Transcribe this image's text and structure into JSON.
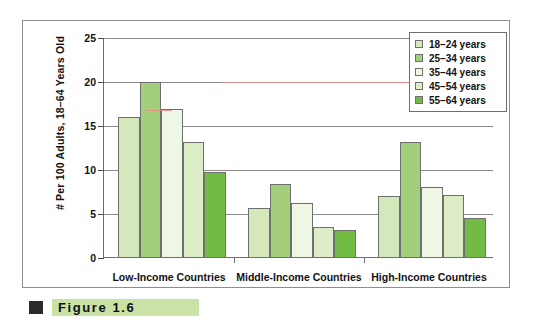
{
  "chart_data": {
    "type": "bar",
    "title": "",
    "subtitle": "",
    "xlabel": "",
    "ylabel": "# Per 100 Adults, 18–64 Years Old",
    "ylim": [
      0,
      25
    ],
    "yticks": [
      0,
      5,
      10,
      15,
      20,
      25
    ],
    "grid": true,
    "legend_position": "top-right",
    "categories": [
      "Low-Income Countries",
      "Middle-Income Countries",
      "High-Income Countries"
    ],
    "series": [
      {
        "name": "18–24 years",
        "color": "#d4e8bc",
        "values": [
          15.9,
          5.6,
          6.9
        ]
      },
      {
        "name": "25–34 years",
        "color": "#a3cf7c",
        "values": [
          19.9,
          8.3,
          13.1
        ]
      },
      {
        "name": "35–44 years",
        "color": "#eef6e4",
        "values": [
          16.8,
          6.1,
          8.0
        ]
      },
      {
        "name": "45–54 years",
        "color": "#dcecc6",
        "values": [
          13.1,
          3.4,
          7.1
        ]
      },
      {
        "name": "55–64 years",
        "color": "#72bb44",
        "values": [
          9.7,
          3.1,
          4.4
        ]
      }
    ]
  },
  "axis": {
    "y_title": "# Per 100 Adults, 18–64 Years Old",
    "tick_labels": [
      "0",
      "5",
      "10",
      "15",
      "20",
      "25"
    ]
  },
  "legend": {
    "items": [
      {
        "label": "18–24 years"
      },
      {
        "label": "25–34 years"
      },
      {
        "label": "35–44 years"
      },
      {
        "label": "45–54 years"
      },
      {
        "label": "55–64 years"
      }
    ]
  },
  "caption": {
    "label": "Figure",
    "number": "1.6",
    "text": "Figure   1.6"
  },
  "colors": {
    "series_1": "#d4e8bc",
    "series_2": "#a3cf7c",
    "series_3": "#eef6e4",
    "series_4": "#dcecc6",
    "series_5": "#72bb44",
    "caption_bar": "#cbe2a6",
    "frame": "#8d8d8d",
    "gridline": "#8a8a8a"
  }
}
